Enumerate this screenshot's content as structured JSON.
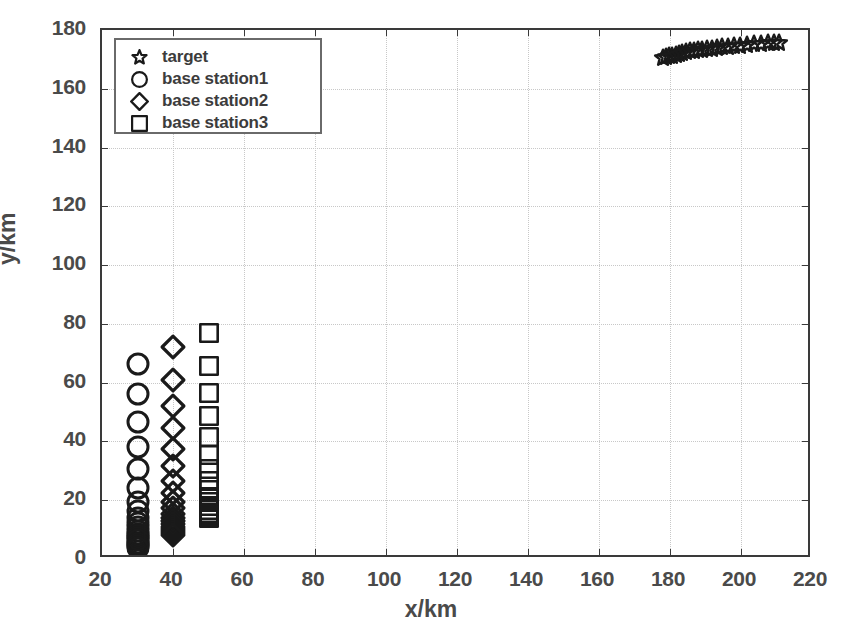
{
  "chart_data": {
    "type": "scatter",
    "title": "",
    "xlabel": "x/km",
    "ylabel": "y/km",
    "xlim": [
      20,
      220
    ],
    "ylim": [
      0,
      180
    ],
    "xticks": [
      20,
      40,
      60,
      80,
      100,
      120,
      140,
      160,
      180,
      200,
      220
    ],
    "yticks": [
      0,
      20,
      40,
      60,
      80,
      100,
      120,
      140,
      160,
      180
    ],
    "grid": true,
    "legend_position": "upper left",
    "series": [
      {
        "name": "target",
        "marker": "star",
        "points": [
          [
            178.0,
            170.4
          ],
          [
            178.9,
            170.7
          ],
          [
            179.8,
            171.0
          ],
          [
            180.7,
            171.3
          ],
          [
            181.6,
            171.6
          ],
          [
            182.5,
            171.9
          ],
          [
            183.5,
            172.2
          ],
          [
            184.5,
            172.5
          ],
          [
            185.6,
            172.7
          ],
          [
            186.7,
            172.9
          ],
          [
            187.9,
            173.1
          ],
          [
            189.1,
            173.3
          ],
          [
            190.4,
            173.5
          ],
          [
            191.8,
            173.7
          ],
          [
            193.2,
            173.9
          ],
          [
            194.7,
            174.1
          ],
          [
            196.3,
            174.3
          ],
          [
            198.0,
            174.5
          ],
          [
            199.8,
            174.7
          ],
          [
            201.7,
            174.9
          ],
          [
            203.6,
            175.1
          ],
          [
            205.6,
            175.3
          ],
          [
            207.7,
            175.5
          ],
          [
            209.4,
            175.6
          ],
          [
            210.8,
            175.7
          ]
        ]
      },
      {
        "name": "base station1",
        "marker": "circle",
        "x": 30,
        "y_values": [
          66.5,
          56.0,
          46.5,
          38.0,
          30.5,
          24.0,
          19.5,
          16.5,
          14.0,
          12.2,
          10.8,
          9.6,
          8.6,
          7.8,
          7.0,
          6.3,
          5.6,
          5.0,
          4.4,
          3.9
        ]
      },
      {
        "name": "base station2",
        "marker": "diamond",
        "x": 40,
        "y_values": [
          72.0,
          61.0,
          52.0,
          44.5,
          37.5,
          31.5,
          26.5,
          22.5,
          19.5,
          17.2,
          15.4,
          14.0,
          12.8,
          11.8,
          10.9,
          10.1,
          9.4,
          8.8,
          8.3
        ]
      },
      {
        "name": "base station3",
        "marker": "square",
        "x": 50,
        "y_values": [
          76.8,
          65.8,
          56.5,
          48.5,
          41.5,
          35.5,
          30.5,
          26.5,
          23.5,
          21.2,
          19.4,
          18.0,
          16.8,
          15.8,
          15.0,
          14.3,
          13.8
        ]
      }
    ]
  },
  "axes": {
    "xlabel": "x/km",
    "ylabel": "y/km",
    "xticks": [
      "20",
      "40",
      "60",
      "80",
      "100",
      "120",
      "140",
      "160",
      "180",
      "200",
      "220"
    ],
    "yticks": [
      "0",
      "20",
      "40",
      "60",
      "80",
      "100",
      "120",
      "140",
      "160",
      "180"
    ]
  },
  "legend": {
    "items": [
      {
        "label": "target",
        "marker": "star-icon"
      },
      {
        "label": "base station1",
        "marker": "circle-icon"
      },
      {
        "label": "base station2",
        "marker": "diamond-icon"
      },
      {
        "label": "base station3",
        "marker": "square-icon"
      }
    ]
  },
  "colors": {
    "marker": "#1a1a1a",
    "axis": "#3a3a3a",
    "grid": "#c8c8c8",
    "text": "#4a4a4a",
    "background": "#ffffff"
  }
}
